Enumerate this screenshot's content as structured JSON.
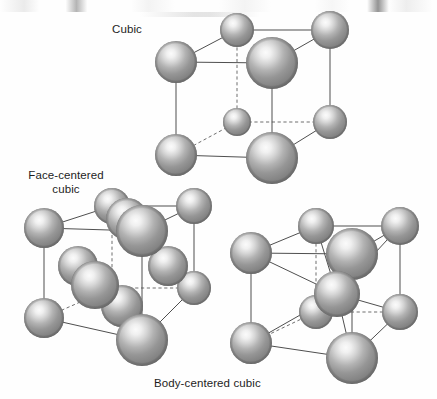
{
  "figure": {
    "type": "diagram",
    "background_color": "#fefefe",
    "sphere_color_edge": "#8c8c8c",
    "sphere_color_highlight": "#f2f2f2",
    "sphere_color_rim": "#6b6b6b",
    "edge_color_solid": "#4f4f4f",
    "edge_color_dashed": "#6e6e6e"
  },
  "labels": {
    "cubic": "Cubic",
    "face_centered_line1": "Face-centered",
    "face_centered_line2": "cubic",
    "body_centered": "Body-centered cubic"
  },
  "structures": [
    {
      "id": "cubic",
      "name": "Cubic",
      "label_position": "top-left-of-cell",
      "corner_atoms": 8,
      "face_atoms": 0,
      "body_atoms": 0,
      "total_atoms_drawn": 8
    },
    {
      "id": "face-centered-cubic",
      "name": "Face-centered cubic",
      "label_position": "above-left-of-cell",
      "corner_atoms": 8,
      "face_atoms": 6,
      "body_atoms": 0,
      "total_atoms_drawn": 14
    },
    {
      "id": "body-centered-cubic",
      "name": "Body-centered cubic",
      "label_position": "below-left-of-cell",
      "corner_atoms": 8,
      "face_atoms": 0,
      "body_atoms": 1,
      "total_atoms_drawn": 9
    }
  ]
}
